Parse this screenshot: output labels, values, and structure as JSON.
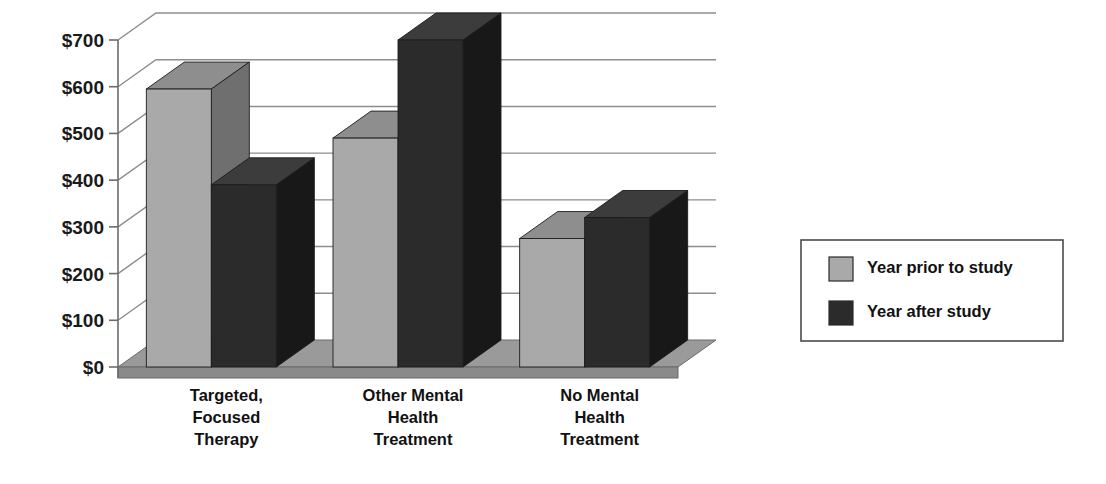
{
  "chart_data": {
    "type": "bar",
    "title": "",
    "subtitle": "",
    "xlabel": "",
    "ylabel": "",
    "ylim": [
      0,
      700
    ],
    "ytick_values": [
      0,
      100,
      200,
      300,
      400,
      500,
      600,
      700
    ],
    "ytick_labels": [
      "$0",
      "$100",
      "$200",
      "$300",
      "$400",
      "$500",
      "$600",
      "$700"
    ],
    "grid": true,
    "three_d": true,
    "legend_position": "right",
    "categories": [
      "Targeted,\nFocused\nTherapy",
      "Other Mental\nHealth\nTreatment",
      "No Mental\nHealth\nTreatment"
    ],
    "category_lines": [
      [
        "Targeted,",
        "Focused",
        "Therapy"
      ],
      [
        "Other Mental",
        "Health",
        "Treatment"
      ],
      [
        "No Mental",
        "Health",
        "Treatment"
      ]
    ],
    "series": [
      {
        "name": "Year prior to study",
        "color": "#a9a9a9",
        "values": [
          595,
          490,
          275
        ]
      },
      {
        "name": "Year after study",
        "color": "#2b2b2b",
        "values": [
          390,
          700,
          320
        ]
      }
    ],
    "annotations": []
  },
  "legend": {
    "items": [
      {
        "label": "Year prior to study",
        "swatch": "light-gray-swatch"
      },
      {
        "label": "Year after study",
        "swatch": "dark-swatch"
      }
    ]
  },
  "colors": {
    "series_light": "#a9a9a9",
    "series_light_top": "#8e8e8e",
    "series_light_side": "#6f6f6f",
    "series_dark": "#2b2b2b",
    "series_dark_top": "#3c3c3c",
    "series_dark_side": "#181818",
    "floor": "#8a8a8a",
    "floor_top": "#9a9a9a",
    "axis": "#6b6b6b",
    "grid": "#8d8d8d",
    "text": "#111111",
    "background": "#ffffff"
  }
}
